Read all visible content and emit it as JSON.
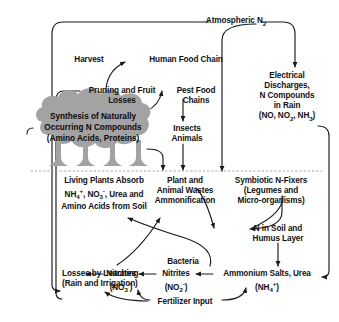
{
  "diagram": {
    "title_node": "Atmospheric N2",
    "type": "nitrogen-cycle-flow-diagram",
    "background_color": "#ffffff",
    "line_color": "#1a1a1a",
    "canopy_color": "#a3a3a3",
    "text_color": "#111111"
  },
  "nodes": {
    "atmospheric_n2": {
      "line1": "Atmospheric N",
      "sub1": "2"
    },
    "harvest": {
      "line1": "Harvest"
    },
    "human_food_chain": {
      "line1": "Human Food Chain"
    },
    "pruning_losses": {
      "line1": "Pruning and Fruit",
      "line2": "Losses"
    },
    "pest_food_chains": {
      "line1": "Pest Food",
      "line2": "Chains"
    },
    "insects_animals": {
      "line1": "Insects",
      "line2": "Animals"
    },
    "electrical_discharges": {
      "line1": "Electrical",
      "line2": "Discharges,",
      "line3": "N Compounds",
      "line4": "in Rain",
      "line5_a": "(NO, NO",
      "line5_sub1": "2",
      "line5_b": ", NH",
      "line5_sub2": "3",
      "line5_c": ")"
    },
    "canopy": {
      "line1": "Synthesis of Naturally",
      "line2": "Occurring N Compounds",
      "line3": "(Amino Acids, Proteins)"
    },
    "living_plants": {
      "line1": "Living Plants Absorb",
      "line2_a": "NH",
      "line2_sub1": "4",
      "line2_sup1": "+",
      "line2_b": ", NO",
      "line2_sub2": "3",
      "line2_sup2": "-",
      "line2_c": ", Urea and",
      "line3": "Amino Acids from Soil"
    },
    "plant_animal_wastes": {
      "line1": "Plant and",
      "line2": "Animal Wastes",
      "line3": "Ammonification"
    },
    "symbiotic_n_fixers": {
      "line1": "Symbiotic N-Fixers",
      "line2": "(Legumes and",
      "line3": "Micro-organisms)"
    },
    "n_in_soil": {
      "line1": "N in Soil and",
      "line2": "Humus Layer"
    },
    "bacteria": {
      "line1": "Bacteria"
    },
    "losses_leaching": {
      "line1": "Losses by Leaching",
      "line2": "(Rain and Irrigation)"
    },
    "nitrates": {
      "line1": "Nitrates",
      "line2_a": "(NO",
      "line2_sub": "3",
      "line2_sup": "-",
      "line2_b": ")"
    },
    "nitrites": {
      "line1": "Nitrites",
      "line2_a": "(NO",
      "line2_sub": "2",
      "line2_sup": "-",
      "line2_b": ")"
    },
    "ammonium_salts": {
      "line1": "Ammonium Salts, Urea",
      "line2_a": "(NH",
      "line2_sub": "4",
      "line2_sup": "+",
      "line2_b": ")"
    },
    "fertilizer_input": {
      "line1": "Fertilizer Input"
    }
  }
}
